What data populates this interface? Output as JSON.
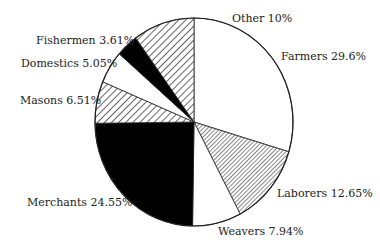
{
  "chart_data": {
    "type": "pie",
    "title": "",
    "start_angle_deg": 0,
    "direction": "clockwise",
    "slices": [
      {
        "label": "Farmers",
        "value": 29.6,
        "display": "Farmers 29.6%",
        "fill": "white"
      },
      {
        "label": "Laborers",
        "value": 12.65,
        "display": "Laborers 12.65%",
        "fill": "dense-hatch"
      },
      {
        "label": "Weavers",
        "value": 7.94,
        "display": "Weavers 7.94%",
        "fill": "white"
      },
      {
        "label": "Merchants",
        "value": 24.55,
        "display": "Merchants 24.55%",
        "fill": "black"
      },
      {
        "label": "Masons",
        "value": 6.51,
        "display": "Masons 6.51%",
        "fill": "hatch"
      },
      {
        "label": "Domestics",
        "value": 5.05,
        "display": "Domestics 5.05%",
        "fill": "white"
      },
      {
        "label": "Fishermen",
        "value": 3.61,
        "display": "Fishermen 3.61%",
        "fill": "black"
      },
      {
        "label": "Other",
        "value": 10,
        "display": "Other 10%",
        "fill": "hatch"
      }
    ],
    "categories": [
      "Farmers",
      "Laborers",
      "Weavers",
      "Merchants",
      "Masons",
      "Domestics",
      "Fishermen",
      "Other"
    ],
    "values": [
      29.6,
      12.65,
      7.94,
      24.55,
      6.51,
      5.05,
      3.61,
      10
    ],
    "legend": "none (inline labels)"
  },
  "labels": {
    "farmers": "Farmers 29.6%",
    "laborers": "Laborers 12.65%",
    "weavers": "Weavers 7.94%",
    "merchants": "Merchants 24.55%",
    "masons": "Masons 6.51%",
    "domestics": "Domestics 5.05%",
    "fishermen": "Fishermen 3.61%",
    "other": "Other 10%"
  }
}
